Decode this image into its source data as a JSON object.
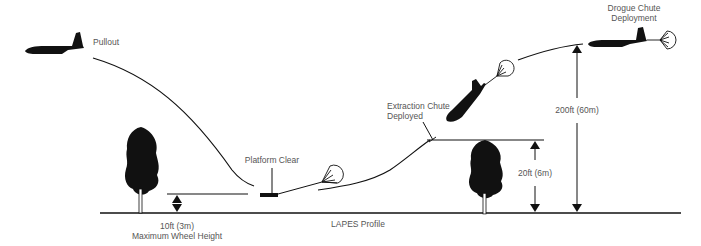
{
  "diagram": {
    "title": "LAPES Profile",
    "colors": {
      "ink": "#111111",
      "text": "#555555",
      "background": "#ffffff"
    },
    "labels": {
      "pullout": "Pullout",
      "platform_clear": "Platform Clear",
      "extraction_chute_line1": "Extraction Chute",
      "extraction_chute_line2": "Deployed",
      "drogue_chute_line1": "Drogue Chute",
      "drogue_chute_line2": "Deployment",
      "wheel_height_value": "10ft (3m)",
      "wheel_height_caption": "Maximum Wheel Height",
      "obstacle_height": "20ft (6m)",
      "approach_height": "200ft (60m)",
      "profile_title": "LAPES Profile"
    },
    "icons": [
      "aircraft-pullout-icon",
      "aircraft-climbing-icon",
      "aircraft-drogue-icon",
      "tree-icon",
      "parachute-icon",
      "platform-icon",
      "double-arrow-icon"
    ]
  }
}
